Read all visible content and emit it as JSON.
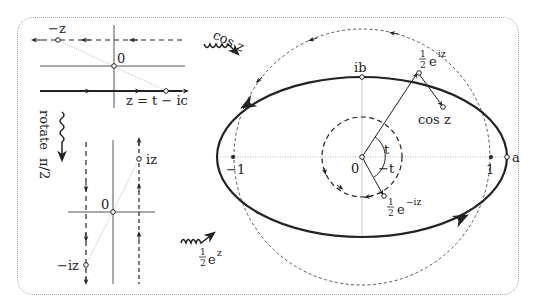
{
  "figure": {
    "colors": {
      "ink": "#222222",
      "axis": "#555555",
      "faint": "#b0b0b0",
      "frame": "#a8a8a8"
    }
  },
  "left_top_panel": {
    "origin_label": "0",
    "neg_z_label": "−z",
    "line_label": "z = t − ic"
  },
  "rotate_step": {
    "label": "rotate",
    "angle_label": "π/2"
  },
  "left_bottom_panel": {
    "origin_label": "0",
    "iz_label": "iz",
    "neg_iz_label": "−iz"
  },
  "exp_step": {
    "frac_num": "1",
    "frac_den": "2",
    "func": "e",
    "exponent": "z"
  },
  "cos_step": {
    "label": "cos z"
  },
  "right_panel": {
    "origin_label": "0",
    "neg_one_label": "−1",
    "one_label": "1",
    "a_label": "a",
    "ib_label": "ib",
    "cos_z_label": "cos z",
    "angle_t_label": "t",
    "angle_neg_t_label": "−t",
    "half_e_iz": {
      "num": "1",
      "den": "2",
      "func": "e",
      "exponent": "iz"
    },
    "half_e_neg_iz": {
      "num": "1",
      "den": "2",
      "func": "e",
      "exponent": "−iz"
    }
  }
}
